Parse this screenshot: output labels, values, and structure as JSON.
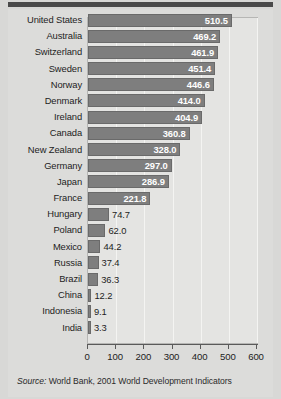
{
  "document": {
    "type": "statistical-figure",
    "source_note": {
      "label": "Source:",
      "text": "World Bank, 2001 World Development Indicators"
    }
  },
  "colors": {
    "page_background": "#d8d8d6",
    "sheet_background": "#dcdcda",
    "top_rule": "#4a4a4a",
    "plot_background": "#e4e4e2",
    "plot_border": "#b6b6b4",
    "gridline": "#f4f4f2",
    "bar_fill": "#7e7e7e",
    "bar_border": "#6a6a6a",
    "axis": "#5a5a5a",
    "label_text": "#1d1d1d",
    "value_text_inside": "#ffffff",
    "value_text_outside": "#1d1d1d"
  },
  "chart_data": {
    "type": "bar",
    "orientation": "horizontal",
    "title": "",
    "subtitle": "",
    "xlabel": "",
    "ylabel": "",
    "xlim": [
      0,
      600
    ],
    "ticks": [
      0,
      100,
      200,
      300,
      400,
      500,
      600
    ],
    "tick_labels": [
      "0",
      "100",
      "200",
      "300",
      "400",
      "500",
      "600"
    ],
    "grid": true,
    "grid_axis": "x",
    "legend": false,
    "legend_position": "none",
    "value_label_inside_threshold": 200,
    "categories": [
      "United States",
      "Australia",
      "Switzerland",
      "Sweden",
      "Norway",
      "Denmark",
      "Ireland",
      "Canada",
      "New Zealand",
      "Germany",
      "Japan",
      "France",
      "Hungary",
      "Poland",
      "Mexico",
      "Russia",
      "Brazil",
      "China",
      "Indonesia",
      "India"
    ],
    "values": [
      510.5,
      469.2,
      461.9,
      451.4,
      446.6,
      414.0,
      404.9,
      360.8,
      328.0,
      297.0,
      286.9,
      221.8,
      74.7,
      62.0,
      44.2,
      37.4,
      36.3,
      12.2,
      9.1,
      3.3
    ],
    "value_labels": [
      "510.5",
      "469.2",
      "461.9",
      "451.4",
      "446.6",
      "414.0",
      "404.9",
      "360.8",
      "328.0",
      "297.0",
      "286.9",
      "221.8",
      "74.7",
      "62.0",
      "44.2",
      "37.4",
      "36.3",
      "12.2",
      "9.1",
      "3.3"
    ]
  }
}
